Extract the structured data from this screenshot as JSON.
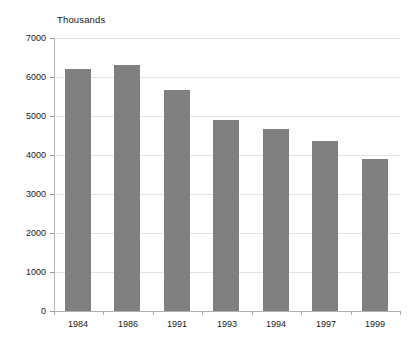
{
  "chart_data": {
    "type": "bar",
    "title": "Thousands",
    "subtitle": "",
    "xlabel": "",
    "ylabel": "",
    "categories": [
      "1984",
      "1986",
      "1991",
      "1993",
      "1994",
      "1997",
      "1999"
    ],
    "values": [
      6200,
      6300,
      5670,
      4900,
      4670,
      4350,
      3900
    ],
    "series": [
      {
        "name": "Thousands",
        "values": [
          6200,
          6300,
          5670,
          4900,
          4670,
          4350,
          3900
        ]
      }
    ],
    "ylim": [
      0,
      7000
    ],
    "ytick_labels": [
      "0",
      "1000",
      "2000",
      "3000",
      "4000",
      "5000",
      "6000",
      "7000"
    ],
    "ytick_values": [
      0,
      1000,
      2000,
      3000,
      4000,
      5000,
      6000,
      7000
    ],
    "grid": true,
    "grid_axis": "y",
    "legend": false,
    "legend_position": "none",
    "bar_color": "#808080",
    "grid_color": "#e2e2e2",
    "axis_color": "#b0b0b0",
    "text_color": "#1a1a1a",
    "background": "#ffffff",
    "annotations": []
  }
}
